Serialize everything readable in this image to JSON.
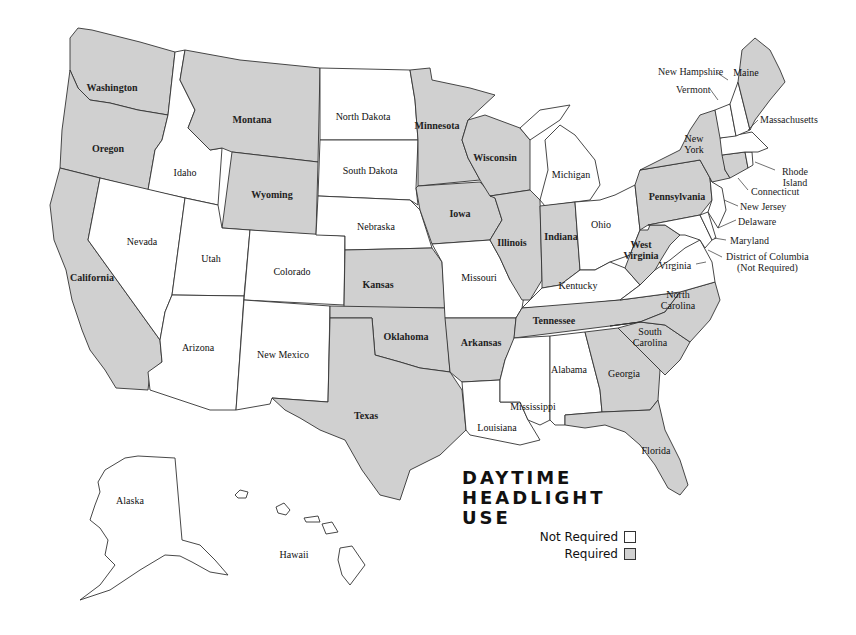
{
  "title": {
    "line1": "DAYTIME",
    "line2": "HEADLIGHT",
    "line3": "USE"
  },
  "legend": [
    {
      "label": "Not Required",
      "color": "#ffffff"
    },
    {
      "label": "Required",
      "color": "#d0d0d0"
    }
  ],
  "colors": {
    "required": "#d0d0d0",
    "not_required": "#ffffff",
    "border": "#333333"
  },
  "states": {
    "washington": {
      "label": "Washington",
      "status": "Required"
    },
    "oregon": {
      "label": "Oregon",
      "status": "Required"
    },
    "california": {
      "label": "California",
      "status": "Required"
    },
    "idaho": {
      "label": "Idaho",
      "status": "Not Required"
    },
    "nevada": {
      "label": "Nevada",
      "status": "Not Required"
    },
    "montana": {
      "label": "Montana",
      "status": "Required"
    },
    "wyoming": {
      "label": "Wyoming",
      "status": "Required"
    },
    "utah": {
      "label": "Utah",
      "status": "Not Required"
    },
    "arizona": {
      "label": "Arizona",
      "status": "Not Required"
    },
    "colorado": {
      "label": "Colorado",
      "status": "Not Required"
    },
    "new_mexico": {
      "label": "New Mexico",
      "status": "Not Required"
    },
    "north_dakota": {
      "label": "North Dakota",
      "status": "Not Required"
    },
    "south_dakota": {
      "label": "South Dakota",
      "status": "Not Required"
    },
    "nebraska": {
      "label": "Nebraska",
      "status": "Not Required"
    },
    "kansas": {
      "label": "Kansas",
      "status": "Required"
    },
    "oklahoma": {
      "label": "Oklahoma",
      "status": "Required"
    },
    "texas": {
      "label": "Texas",
      "status": "Required"
    },
    "minnesota": {
      "label": "Minnesota",
      "status": "Required"
    },
    "iowa": {
      "label": "Iowa",
      "status": "Required"
    },
    "missouri": {
      "label": "Missouri",
      "status": "Not Required"
    },
    "arkansas": {
      "label": "Arkansas",
      "status": "Required"
    },
    "louisiana": {
      "label": "Louisiana",
      "status": "Not Required"
    },
    "wisconsin": {
      "label": "Wisconsin",
      "status": "Required"
    },
    "illinois": {
      "label": "Illinois",
      "status": "Required"
    },
    "michigan": {
      "label": "Michigan",
      "status": "Not Required"
    },
    "indiana": {
      "label": "Indiana",
      "status": "Required"
    },
    "ohio": {
      "label": "Ohio",
      "status": "Not Required"
    },
    "kentucky": {
      "label": "Kentucky",
      "status": "Not Required"
    },
    "tennessee": {
      "label": "Tennessee",
      "status": "Required"
    },
    "mississippi": {
      "label": "Mississippi",
      "status": "Not Required"
    },
    "alabama": {
      "label": "Alabama",
      "status": "Not Required"
    },
    "georgia": {
      "label": "Georgia",
      "status": "Required"
    },
    "florida": {
      "label": "Florida",
      "status": "Required"
    },
    "south_carolina": {
      "label": "South Carolina",
      "status": "Required"
    },
    "north_carolina": {
      "label": "North Carolina",
      "status": "Required"
    },
    "virginia": {
      "label": "Virginia",
      "status": "Not Required"
    },
    "west_virginia": {
      "label": "West Virginia",
      "status": "Required"
    },
    "pennsylvania": {
      "label": "Pennsylvania",
      "status": "Required"
    },
    "new_york": {
      "label": "New York",
      "status": "Required"
    },
    "new_jersey": {
      "label": "New Jersey",
      "status": "Not Required"
    },
    "delaware": {
      "label": "Delaware",
      "status": "Not Required"
    },
    "maryland": {
      "label": "Maryland",
      "status": "Not Required"
    },
    "district_of_columbia": {
      "label": "District of Columbia",
      "note": "(Not Required)",
      "status": "Not Required"
    },
    "connecticut": {
      "label": "Connecticut",
      "status": "Required"
    },
    "rhode_island": {
      "label": "Rhode Island",
      "status": "Not Required"
    },
    "massachusetts": {
      "label": "Massachusetts",
      "status": "Not Required"
    },
    "vermont": {
      "label": "Vermont",
      "status": "Not Required"
    },
    "new_hampshire": {
      "label": "New Hampshire",
      "status": "Not Required"
    },
    "maine": {
      "label": "Maine",
      "status": "Required"
    },
    "alaska": {
      "label": "Alaska",
      "status": "Not Required"
    },
    "hawaii": {
      "label": "Hawaii",
      "status": "Not Required"
    }
  }
}
